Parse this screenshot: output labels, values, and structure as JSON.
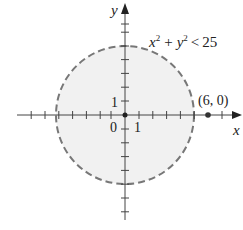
{
  "figure": {
    "type": "coordinate-plane-region",
    "inequality": "x^2 + y^2 < 25",
    "inequality_parts": {
      "x": "x",
      "y": "y",
      "exp": "2",
      "plus": "+",
      "rel": "<",
      "rhs": "25"
    },
    "axes": {
      "x_label": "x",
      "y_label": "y",
      "origin_label": "0",
      "x_unit_label": "1",
      "y_unit_label": "1",
      "x_range": [
        -8,
        8
      ],
      "y_range": [
        -8,
        8
      ]
    },
    "circle": {
      "center": [
        0,
        0
      ],
      "radius": 5,
      "boundary": "dashed",
      "fill": "#f1f1f1",
      "stroke": "#777777"
    },
    "point": {
      "label": "(6, 0)",
      "coords": [
        6,
        0
      ]
    },
    "colors": {
      "axis": "#444444",
      "boundary": "#777777",
      "region": "#f1f1f1",
      "text": "#222222"
    }
  }
}
